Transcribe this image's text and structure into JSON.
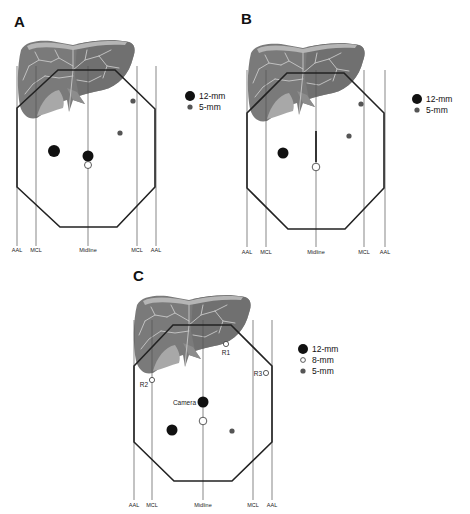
{
  "figure": {
    "panels": [
      {
        "id": "A",
        "label": "A",
        "reference_lines": [
          "AAL",
          "MCL",
          "Midline",
          "MCL",
          "AAL"
        ],
        "legend": [
          {
            "size": "12-mm",
            "style": "filled-large"
          },
          {
            "size": "5-mm",
            "style": "filled-small-gray"
          }
        ],
        "ports": [
          {
            "type": "12-mm",
            "position": "left upper quadrant mid-clavicular area"
          },
          {
            "type": "12-mm",
            "position": "midline above umbilicus"
          },
          {
            "type": "umbilicus",
            "position": "midline"
          },
          {
            "type": "5-mm",
            "position": "right subcostal near MCL"
          },
          {
            "type": "5-mm",
            "position": "right mid abdomen"
          }
        ]
      },
      {
        "id": "B",
        "label": "B",
        "reference_lines": [
          "AAL",
          "MCL",
          "Midline",
          "MCL",
          "AAL"
        ],
        "legend": [
          {
            "size": "12-mm",
            "style": "filled-large"
          },
          {
            "size": "5-mm",
            "style": "filled-small-gray"
          }
        ],
        "ports": [
          {
            "type": "12-mm",
            "position": "left mid abdomen"
          },
          {
            "type": "umbilicus",
            "position": "midline with vertical midline incision"
          },
          {
            "type": "5-mm",
            "position": "right subcostal near MCL"
          },
          {
            "type": "5-mm",
            "position": "right mid abdomen"
          }
        ]
      },
      {
        "id": "C",
        "label": "C",
        "reference_lines": [
          "AAL",
          "MCL",
          "Midline",
          "MCL",
          "AAL"
        ],
        "legend": [
          {
            "size": "12-mm",
            "style": "filled-large"
          },
          {
            "size": "8-mm",
            "style": "open-small"
          },
          {
            "size": "5-mm",
            "style": "filled-small-gray"
          }
        ],
        "port_labels": [
          "R1",
          "R2",
          "R3",
          "Camera"
        ],
        "ports": [
          {
            "type": "8-mm",
            "label": "R1",
            "position": "right upper quadrant"
          },
          {
            "type": "8-mm",
            "label": "R2",
            "position": "left MCL"
          },
          {
            "type": "8-mm",
            "label": "R3",
            "position": "right AAL"
          },
          {
            "type": "12-mm",
            "label": "Camera",
            "position": "midline"
          },
          {
            "type": "umbilicus",
            "position": "midline below camera"
          },
          {
            "type": "12-mm",
            "position": "left lower abdomen"
          },
          {
            "type": "5-mm",
            "position": "right lower abdomen"
          }
        ]
      }
    ]
  },
  "colors": {
    "port_12mm": "#111111",
    "port_5mm": "#555555",
    "port_8mm_open": "#ffffff",
    "outline": "#222222",
    "liver": "#777777"
  }
}
